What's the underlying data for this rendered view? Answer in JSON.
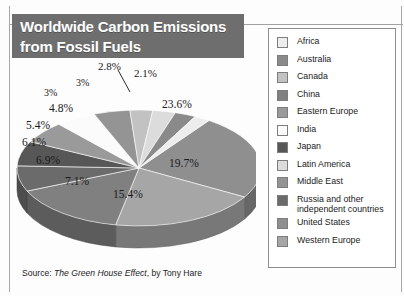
{
  "title": {
    "line1": "Worldwide Carbon Emissions",
    "line2": "from Fossil Fuels",
    "banner_color": "#6e6e6e",
    "text_color": "#ffffff"
  },
  "source": {
    "prefix": "Source: ",
    "book": "The Green House Effect",
    "suffix": ", by Tony Hare"
  },
  "legend": {
    "position": "right",
    "items": [
      {
        "label": "Africa",
        "label2": "",
        "color": "#ededed"
      },
      {
        "label": "Australia",
        "label2": "",
        "color": "#8a8a8a"
      },
      {
        "label": "Canada",
        "label2": "",
        "color": "#c2c2c2"
      },
      {
        "label": "China",
        "label2": "",
        "color": "#808080"
      },
      {
        "label": "Eastern Europe",
        "label2": "",
        "color": "#9a9a9a"
      },
      {
        "label": "India",
        "label2": "",
        "color": "#fbfbfb"
      },
      {
        "label": "Japan",
        "label2": "",
        "color": "#575757"
      },
      {
        "label": "Latin America",
        "label2": "",
        "color": "#dcdcdc"
      },
      {
        "label": "Middle East",
        "label2": "",
        "color": "#949494"
      },
      {
        "label": "Russia and other",
        "label2": "independent countries",
        "color": "#6b6b6b"
      },
      {
        "label": "United States",
        "label2": "",
        "color": "#8f8f8f"
      },
      {
        "label": "Western Europe",
        "label2": "",
        "color": "#a6a6a6"
      }
    ]
  },
  "chart_data": {
    "type": "pie",
    "title": "Worldwide Carbon Emissions from Fossil Fuels",
    "subtitle": "",
    "xlabel": "",
    "ylabel": "",
    "grid": false,
    "legend_position": "right",
    "three_d": true,
    "value_unit": "%",
    "categories": [
      "United States",
      "Western Europe",
      "China",
      "Russia and other independent countries",
      "Japan",
      "Eastern Europe",
      "India",
      "Middle East",
      "Canada",
      "Latin America",
      "Australia",
      "Africa"
    ],
    "values": [
      23.6,
      19.7,
      15.4,
      7.1,
      6.9,
      6.1,
      5.4,
      4.8,
      3.0,
      3.0,
      2.8,
      2.1
    ],
    "data_labels": [
      "23.6%",
      "19.7%",
      "15.4%",
      "7.1%",
      "6.9%",
      "6.1%",
      "5.4%",
      "4.8%",
      "3%",
      "3%",
      "2.8%",
      "2.1%"
    ],
    "colors": [
      "#8f8f8f",
      "#a6a6a6",
      "#808080",
      "#6b6b6b",
      "#575757",
      "#9a9a9a",
      "#fbfbfb",
      "#949494",
      "#c2c2c2",
      "#dcdcdc",
      "#8a8a8a",
      "#ededed"
    ],
    "total": 99.9
  },
  "labels": {
    "l_236": "23.6%",
    "l_197": "19.7%",
    "l_154": "15.4%",
    "l_71": "7.1%",
    "l_69": "6.9%",
    "l_61": "6.1%",
    "l_54": "5.4%",
    "l_48": "4.8%",
    "l_30a": "3%",
    "l_30b": "3%",
    "l_28": "2.8%",
    "l_21": "2.1%"
  }
}
